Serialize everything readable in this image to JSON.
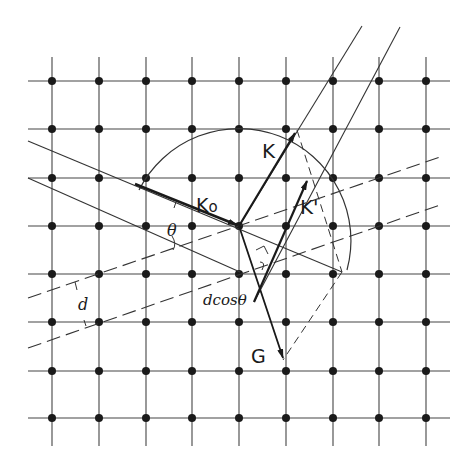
{
  "diagram": {
    "type": "Ewald sphere construction / Bragg reflection on a square lattice",
    "colors": {
      "ink": "#1a1a1a",
      "background": "#ffffff"
    },
    "lattice": {
      "x": [
        52,
        99,
        146,
        192,
        239,
        286,
        333,
        379,
        426
      ],
      "y": [
        81,
        129,
        178,
        226,
        274,
        322,
        371,
        418
      ]
    },
    "labels": {
      "k0": "K",
      "k0_sub": "o",
      "k": "K",
      "k_prime": "K'",
      "g": "G",
      "theta": "θ",
      "d": "d",
      "dcos": "dcosθ"
    }
  }
}
